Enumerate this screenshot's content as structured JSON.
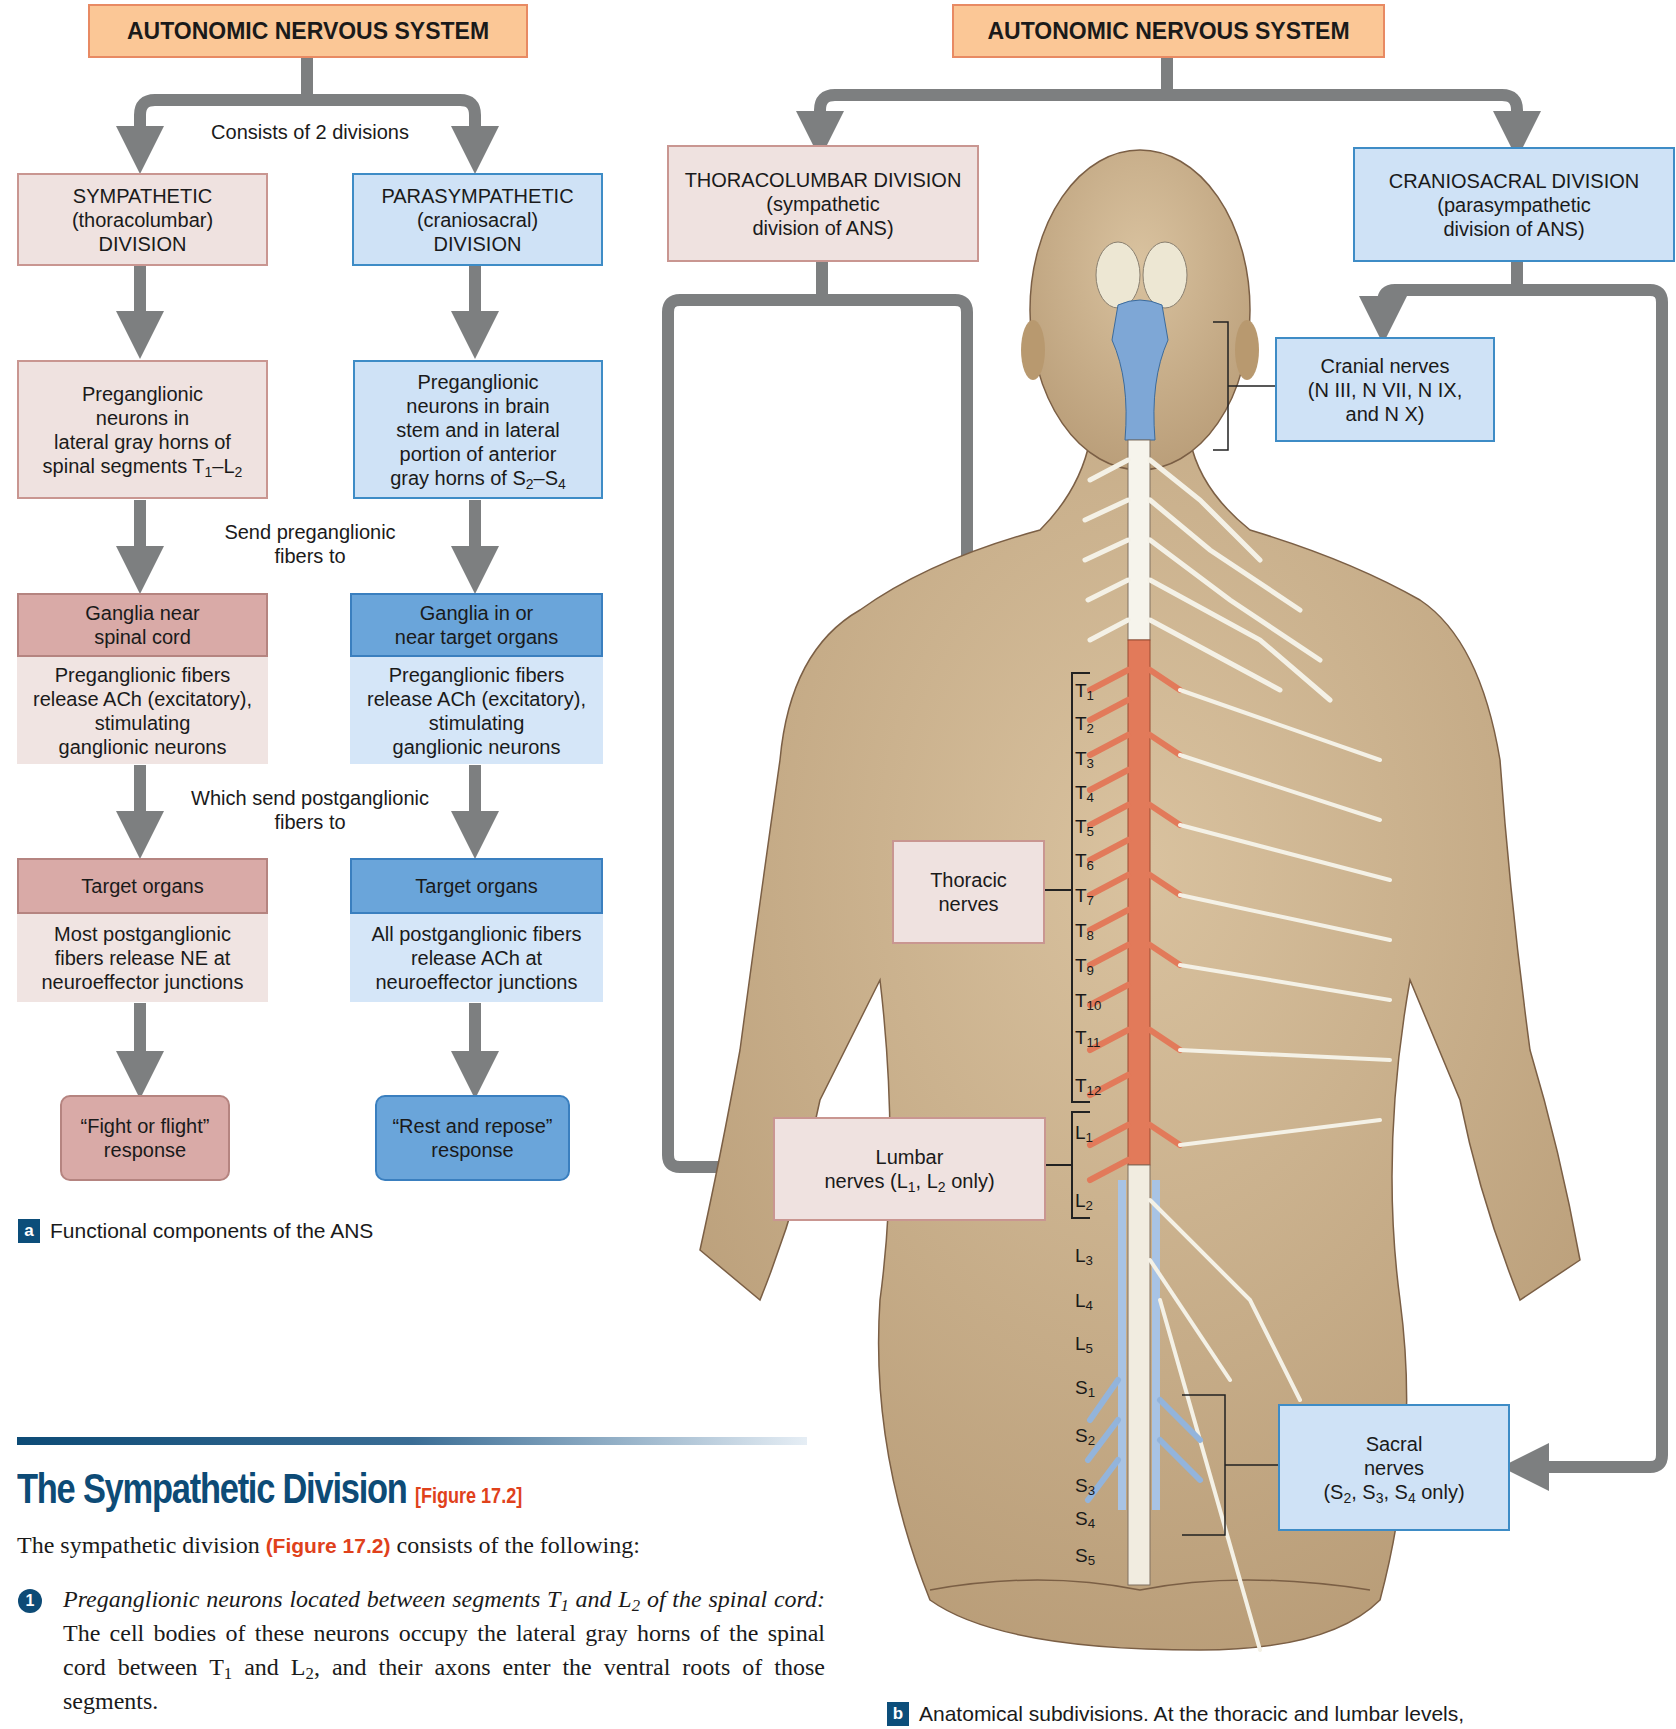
{
  "panel_a": {
    "header": "AUTONOMIC NERVOUS SYSTEM",
    "connector_1": "Consists of 2 divisions",
    "connector_2_line1": "Send preganglionic",
    "connector_2_line2": "fibers to",
    "connector_3_line1": "Which send postganglionic",
    "connector_3_line2": "fibers to",
    "sympathetic": {
      "division": [
        "SYMPATHETIC",
        "(thoracolumbar)",
        "DIVISION"
      ],
      "preganglionic": [
        "Preganglionic",
        "neurons in",
        "lateral gray horns of",
        "spinal segments T",
        "1",
        "–L",
        "2"
      ],
      "ganglia_title": [
        "Ganglia near",
        "spinal cord"
      ],
      "ganglia_desc": [
        "Preganglionic fibers",
        "release ACh (excitatory),",
        "stimulating",
        "ganglionic neurons"
      ],
      "target_title": "Target organs",
      "target_desc": [
        "Most postganglionic",
        "fibers release NE at",
        "neuroeffector junctions"
      ],
      "response": [
        "“Fight or flight”",
        "response"
      ]
    },
    "parasympathetic": {
      "division": [
        "PARASYMPATHETIC",
        "(craniosacral)",
        "DIVISION"
      ],
      "preganglionic": [
        "Preganglionic",
        "neurons in brain",
        "stem and in lateral",
        "portion of anterior",
        "gray horns of S",
        "2",
        "–S",
        "4"
      ],
      "ganglia_title": [
        "Ganglia in or",
        "near target organs"
      ],
      "ganglia_desc": [
        "Preganglionic fibers",
        "release ACh (excitatory),",
        "stimulating",
        "ganglionic neurons"
      ],
      "target_title": "Target organs",
      "target_desc": [
        "All postganglionic fibers",
        "release ACh at",
        "neuroeffector junctions"
      ],
      "response": [
        "“Rest and repose”",
        "response"
      ]
    },
    "caption_badge": "a",
    "caption": "Functional components of the ANS"
  },
  "panel_b": {
    "header": "AUTONOMIC NERVOUS SYSTEM",
    "thoracolumbar": [
      "THORACOLUMBAR DIVISION",
      "(sympathetic",
      "division of ANS)"
    ],
    "craniosacral": [
      "CRANIOSACRAL DIVISION",
      "(parasympathetic",
      "division of ANS)"
    ],
    "cranial_nerves": [
      "Cranial nerves",
      "(N III, N VII, N IX,",
      "and N X)"
    ],
    "thoracic_nerves": [
      "Thoracic",
      "nerves"
    ],
    "lumbar_nerves": [
      "Lumbar",
      "nerves (L",
      "1",
      ", L",
      "2",
      " only)"
    ],
    "sacral_nerves": [
      "Sacral",
      "nerves",
      "(S",
      "2",
      ", S",
      "3",
      ", S",
      "4",
      " only)"
    ],
    "segments": [
      {
        "l": "T",
        "n": "1"
      },
      {
        "l": "T",
        "n": "2"
      },
      {
        "l": "T",
        "n": "3"
      },
      {
        "l": "T",
        "n": "4"
      },
      {
        "l": "T",
        "n": "5"
      },
      {
        "l": "T",
        "n": "6"
      },
      {
        "l": "T",
        "n": "7"
      },
      {
        "l": "T",
        "n": "8"
      },
      {
        "l": "T",
        "n": "9"
      },
      {
        "l": "T",
        "n": "10"
      },
      {
        "l": "T",
        "n": "11"
      },
      {
        "l": "T",
        "n": "12"
      },
      {
        "l": "L",
        "n": "1"
      },
      {
        "l": "L",
        "n": "2"
      },
      {
        "l": "L",
        "n": "3"
      },
      {
        "l": "L",
        "n": "4"
      },
      {
        "l": "L",
        "n": "5"
      },
      {
        "l": "S",
        "n": "1"
      },
      {
        "l": "S",
        "n": "2"
      },
      {
        "l": "S",
        "n": "3"
      },
      {
        "l": "S",
        "n": "4"
      },
      {
        "l": "S",
        "n": "5"
      }
    ],
    "caption_badge": "b",
    "caption": "Anatomical subdivisions. At the thoracic and lumbar levels,"
  },
  "text_section": {
    "title": "The Sympathetic Division",
    "title_ref": "[Figure 17.2]",
    "intro_pre": "The sympathetic division ",
    "intro_ref": "(Figure 17.2)",
    "intro_post": " consists of the following:",
    "item1_badge": "1",
    "item1_italic_a": "Preganglionic neurons located between segments T",
    "item1_italic_sub1": "1",
    "item1_italic_b": " and L",
    "item1_italic_sub2": "2",
    "item1_italic_c": " of the spinal cord:",
    "item1_text_a": " The cell bodies of these neurons occupy the lateral gray horns of the spinal cord between T",
    "item1_text_sub1": "1",
    "item1_text_b": " and L",
    "item1_text_sub2": "2",
    "item1_text_c": ", and their axons enter the ventral roots of those segments."
  },
  "colors": {
    "header_fill": "#fbc796",
    "sympathetic_fill": "#efe2e0",
    "sympathetic_dark": "#d9aaa7",
    "parasympathetic_fill": "#cfe2f6",
    "parasympathetic_dark": "#6aa5da",
    "arrow_gray": "#7d7f80",
    "skin": "#c8ad88",
    "sympathetic_cord": "#e27a5a",
    "parasympathetic_cord": "#7ea7d6",
    "title_blue": "#0d4b76",
    "ref_red": "#e0411b"
  }
}
